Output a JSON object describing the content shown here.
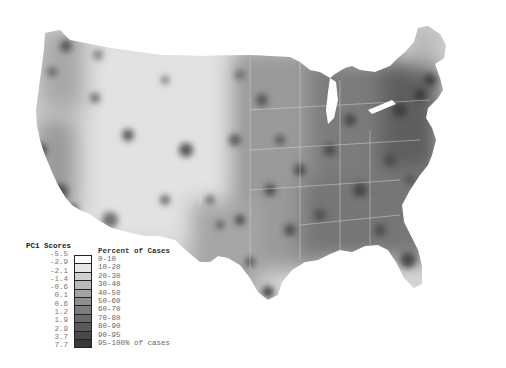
{
  "map": {
    "title": "US county choropleth",
    "colormap": "grayscale"
  },
  "legend": {
    "scores_title": "PC1 Scores",
    "percent_title": "Percent of Cases",
    "scores": [
      "-5.5",
      "-2.9",
      "-2.1",
      "-1.4",
      "-0.6",
      "0.1",
      "0.6",
      "1.2",
      "1.9",
      "2.9",
      "3.7",
      "7.7"
    ],
    "bins": [
      {
        "label": "0-10",
        "color": "#fafafa"
      },
      {
        "label": "10-20",
        "color": "#e6e6e6"
      },
      {
        "label": "20-30",
        "color": "#cfcfcf"
      },
      {
        "label": "30-40",
        "color": "#b9b9b9"
      },
      {
        "label": "40-50",
        "color": "#a3a3a3"
      },
      {
        "label": "50-60",
        "color": "#8f8f8f"
      },
      {
        "label": "60-70",
        "color": "#7c7c7c"
      },
      {
        "label": "70-80",
        "color": "#6a6a6a"
      },
      {
        "label": "80-90",
        "color": "#595959"
      },
      {
        "label": "90-95",
        "color": "#494949"
      },
      {
        "label": "95-100% of cases",
        "color": "#393939"
      }
    ]
  }
}
